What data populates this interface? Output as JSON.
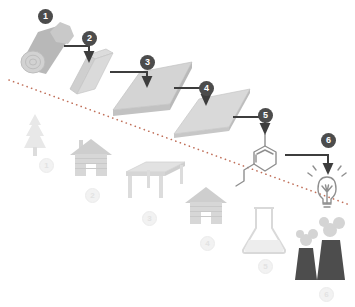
{
  "diagram": {
    "divider": {
      "name": "dotted-diagonal-divider",
      "style": "dotted",
      "color": "#c0705a",
      "x1": 9,
      "y1": 80,
      "x2": 350,
      "y2": 205
    },
    "colors": {
      "arrow": "#3d3d3d",
      "badge_top_fill": "#4c4c4c",
      "badge_top_text": "#ffffff",
      "badge_bottom_fill": "#f2f2f2",
      "badge_bottom_text": "#e3e3e3",
      "wood_light": "#d9d9d9",
      "wood_mid": "#c4c4c4",
      "wood_dark": "#a8a8a8",
      "faint_gray": "#e6e6e6",
      "factory_dark": "#4d4d4d",
      "outline": "#8c8c8c",
      "background": "#ffffff"
    },
    "top_chain": {
      "name": "processing-chain",
      "steps": [
        {
          "number": "1",
          "icon": "log-icon",
          "label": "log",
          "badge_x": 38,
          "badge_y": 9
        },
        {
          "number": "2",
          "icon": "beam-icon",
          "label": "beam",
          "badge_x": 82,
          "badge_y": 31
        },
        {
          "number": "3",
          "icon": "board-icon",
          "label": "board",
          "badge_x": 140,
          "badge_y": 55
        },
        {
          "number": "4",
          "icon": "panel-icon",
          "label": "panel",
          "badge_x": 199,
          "badge_y": 81
        },
        {
          "number": "5",
          "icon": "molecule-icon",
          "label": "lignin molecule",
          "badge_x": 258,
          "badge_y": 108
        },
        {
          "number": "6",
          "icon": "lightbulb-icon",
          "label": "energy",
          "badge_x": 321,
          "badge_y": 133
        }
      ]
    },
    "bottom_row": {
      "name": "end-use-row",
      "items": [
        {
          "number": "1",
          "icon": "tree-icon",
          "label": "tree",
          "badge_x": 39,
          "badge_y": 158
        },
        {
          "number": "2",
          "icon": "house-chimney-icon",
          "label": "house with chimney",
          "badge_x": 85,
          "badge_y": 188
        },
        {
          "number": "3",
          "icon": "table-icon",
          "label": "table",
          "badge_x": 142,
          "badge_y": 211
        },
        {
          "number": "4",
          "icon": "house-icon",
          "label": "house",
          "badge_x": 200,
          "badge_y": 236
        },
        {
          "number": "5",
          "icon": "flask-icon",
          "label": "flask",
          "badge_x": 258,
          "badge_y": 259
        },
        {
          "number": "6",
          "icon": "factory-icon",
          "label": "factory",
          "badge_x": 319,
          "badge_y": 287
        }
      ]
    }
  }
}
